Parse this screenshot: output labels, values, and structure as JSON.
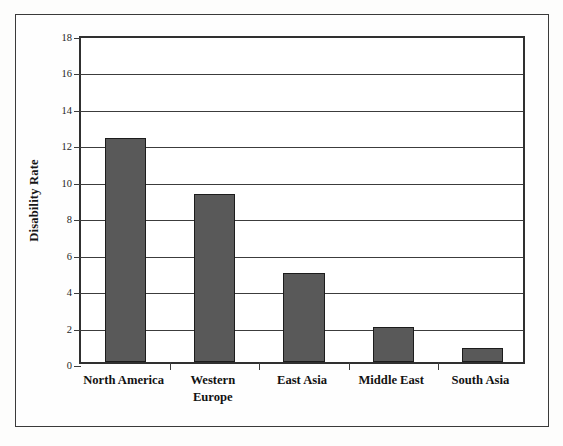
{
  "chart_data": {
    "type": "bar",
    "title": "",
    "xlabel": "",
    "ylabel": "Disability Rate",
    "categories": [
      "North America",
      "Western Europe",
      "East Asia",
      "Middle East",
      "South Asia"
    ],
    "category_lines": [
      [
        "North America"
      ],
      [
        "Western",
        "Europe"
      ],
      [
        "East Asia"
      ],
      [
        "Middle East"
      ],
      [
        "South Asia"
      ]
    ],
    "values": [
      12.3,
      9.2,
      4.9,
      1.9,
      0.75
    ],
    "ylim": [
      0,
      18
    ],
    "ytick_labels": [
      "0",
      "2",
      "4",
      "6",
      "8",
      "10",
      "12",
      "14",
      "16",
      "18"
    ],
    "ytick_values": [
      0,
      2,
      4,
      6,
      8,
      10,
      12,
      14,
      16,
      18
    ],
    "ytick_step": 2,
    "grid": true,
    "grid_axis": "y",
    "legend": "none",
    "bar_color": "#595959",
    "bar_edge_color": "#1c1c1c",
    "axis_color": "#303030",
    "grid_color": "#3c3c3c",
    "background_color": "#ffffff",
    "bar_width_ratio": 0.46
  }
}
